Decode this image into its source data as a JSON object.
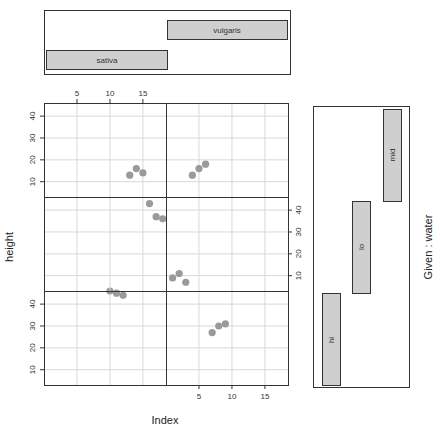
{
  "chart_data": {
    "type": "scatter",
    "title": "",
    "xlabel": "Index",
    "ylabel": "height",
    "given_label": "Given : water",
    "layout": "coplot 2 columns x 3 rows",
    "grid": true,
    "xlim": [
      0,
      18.5
    ],
    "ylim": [
      3,
      46
    ],
    "x_ticks": [
      5,
      10,
      15
    ],
    "y_ticks": [
      10,
      20,
      30,
      40
    ],
    "column_factor": {
      "name": "species",
      "levels": [
        {
          "label": "sativa",
          "range": [
            0,
            0.5
          ]
        },
        {
          "label": "vulgaris",
          "range": [
            0.5,
            1
          ]
        }
      ]
    },
    "row_factor": {
      "name": "water",
      "levels": [
        {
          "label": "hi",
          "range": [
            0,
            0.333
          ]
        },
        {
          "label": "lo",
          "range": [
            0.333,
            0.667
          ]
        },
        {
          "label": "mid",
          "range": [
            0.667,
            1
          ]
        }
      ]
    },
    "panels": [
      {
        "species": "sativa",
        "water": "hi",
        "row": 3,
        "col": 1,
        "points": [
          [
            10,
            46
          ],
          [
            11,
            45
          ],
          [
            12,
            44
          ]
        ]
      },
      {
        "species": "vulgaris",
        "water": "hi",
        "row": 3,
        "col": 2,
        "points": [
          [
            7,
            27
          ],
          [
            8,
            30
          ],
          [
            9,
            31
          ]
        ]
      },
      {
        "species": "sativa",
        "water": "lo",
        "row": 2,
        "col": 1,
        "points": [
          [
            16,
            43
          ],
          [
            17,
            37
          ],
          [
            18,
            36
          ]
        ]
      },
      {
        "species": "vulgaris",
        "water": "lo",
        "row": 2,
        "col": 2,
        "points": [
          [
            1,
            9
          ],
          [
            2,
            11
          ],
          [
            3,
            7
          ]
        ]
      },
      {
        "species": "sativa",
        "water": "mid",
        "row": 1,
        "col": 1,
        "points": [
          [
            13,
            13
          ],
          [
            14,
            16
          ],
          [
            15,
            14
          ]
        ]
      },
      {
        "species": "vulgaris",
        "water": "mid",
        "row": 1,
        "col": 2,
        "points": [
          [
            4,
            13
          ],
          [
            5,
            16
          ],
          [
            6,
            18
          ]
        ]
      }
    ]
  },
  "labels": {
    "xlabel": "Index",
    "ylabel": "height",
    "given": "Given : water",
    "species_sativa": "sativa",
    "species_vulgaris": "vulgaris",
    "water_hi": "hi",
    "water_lo": "lo",
    "water_mid": "mid"
  },
  "colors": {
    "point": "#9a9a9a",
    "bar_fill": "#cfcfcf",
    "axis": "#333333",
    "grid": "#d8d8d8"
  }
}
